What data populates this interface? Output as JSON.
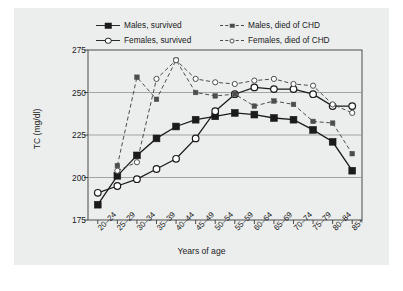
{
  "chart_data": {
    "type": "line",
    "title": "",
    "xlabel": "Years of age",
    "ylabel": "TC (mg/dl)",
    "ylim": [
      175,
      275
    ],
    "yticks": [
      175,
      200,
      225,
      250,
      275
    ],
    "grid": true,
    "legend_position": "top",
    "categories": [
      "20–24",
      "25–29",
      "30–34",
      "35–39",
      "40–44",
      "45–49",
      "50–54",
      "55–59",
      "60–64",
      "65–69",
      "70–74",
      "75–79",
      "80–84",
      "85+"
    ],
    "series": [
      {
        "name": "Males, survived",
        "line": "solid",
        "marker": "filled-square",
        "color": "#1b1b1b",
        "values": [
          184,
          201,
          213,
          223,
          230,
          234,
          236,
          238,
          237,
          235,
          234,
          228,
          221,
          204
        ]
      },
      {
        "name": "Females, survived",
        "line": "solid",
        "marker": "open-circle",
        "color": "#1b1b1b",
        "values": [
          191,
          195,
          199,
          205,
          211,
          223,
          239,
          249,
          253,
          252,
          252,
          249,
          242,
          242
        ]
      },
      {
        "name": "Males, died of CHD",
        "line": "dashed",
        "marker": "small-filled-square",
        "color": "#4d4d4d",
        "values": [
          null,
          207,
          259,
          246,
          269,
          250,
          248,
          249,
          242,
          245,
          243,
          233,
          232,
          214
        ]
      },
      {
        "name": "Females, died of CHD",
        "line": "dashed",
        "marker": "small-open-circle",
        "color": "#4d4d4d",
        "values": [
          null,
          204,
          209,
          258,
          269,
          258,
          256,
          255,
          257,
          258,
          255,
          254,
          243,
          238
        ]
      }
    ]
  },
  "legend": {
    "items": [
      {
        "label": "Males, survived"
      },
      {
        "label": "Males, died of CHD"
      },
      {
        "label": "Females, survived"
      },
      {
        "label": "Females, died of CHD"
      }
    ]
  }
}
